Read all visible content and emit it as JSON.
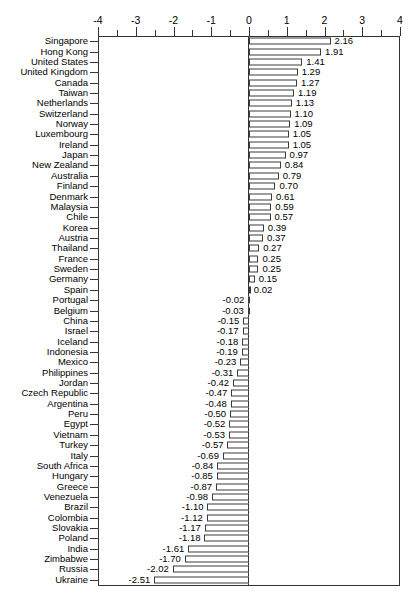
{
  "chart_data": {
    "type": "bar",
    "orientation": "horizontal",
    "title": "",
    "subtitle": "",
    "xlabel": "",
    "ylabel": "",
    "xlim": [
      -4,
      4
    ],
    "grid": false,
    "legend": null,
    "axis": {
      "major_ticks": [
        -4,
        -3,
        -2,
        -1,
        0,
        1,
        2,
        3,
        4
      ],
      "major_tick_labels": [
        "-4",
        "-3",
        "-2",
        "-1",
        "0",
        "1",
        "2",
        "3",
        "4"
      ],
      "minor_ticks": [
        -3.5,
        -2.5,
        -1.5,
        -0.5,
        0.5,
        1.5,
        2.5,
        3.5
      ],
      "tick_position": "top",
      "zero_reference_line": 0
    },
    "bar_style": {
      "fill": "#ffffff",
      "stroke": "#3a3a3a"
    },
    "value_label_format": "2 decimals",
    "categories": [
      "Singapore",
      "Hong Kong",
      "United States",
      "United Kingdom",
      "Canada",
      "Taiwan",
      "Netherlands",
      "Switzerland",
      "Norway",
      "Luxembourg",
      "Ireland",
      "Japan",
      "New Zealand",
      "Australia",
      "Finland",
      "Denmark",
      "Malaysia",
      "Chile",
      "Korea",
      "Austria",
      "Thailand",
      "France",
      "Sweden",
      "Germany",
      "Spain",
      "Portugal",
      "Belgium",
      "China",
      "Israel",
      "Iceland",
      "Indonesia",
      "Mexico",
      "Philippines",
      "Jordan",
      "Czech Republic",
      "Argentina",
      "Peru",
      "Egypt",
      "Vietnam",
      "Turkey",
      "Italy",
      "South Africa",
      "Hungary",
      "Greece",
      "Venezuela",
      "Brazil",
      "Colombia",
      "Slovakia",
      "Poland",
      "India",
      "Zimbabwe",
      "Russia",
      "Ukraine"
    ],
    "values": [
      2.16,
      1.91,
      1.41,
      1.29,
      1.27,
      1.19,
      1.13,
      1.1,
      1.09,
      1.05,
      1.05,
      0.97,
      0.84,
      0.79,
      0.7,
      0.61,
      0.59,
      0.57,
      0.39,
      0.37,
      0.27,
      0.25,
      0.25,
      0.15,
      0.02,
      -0.02,
      -0.03,
      -0.15,
      -0.17,
      -0.18,
      -0.19,
      -0.23,
      -0.31,
      -0.42,
      -0.47,
      -0.48,
      -0.5,
      -0.52,
      -0.53,
      -0.57,
      -0.69,
      -0.84,
      -0.85,
      -0.87,
      -0.98,
      -1.1,
      -1.12,
      -1.17,
      -1.18,
      -1.61,
      -1.7,
      -2.02,
      -2.51
    ],
    "value_labels": [
      "2.16",
      "1.91",
      "1.41",
      "1.29",
      "1.27",
      "1.19",
      "1.13",
      "1.10",
      "1.09",
      "1.05",
      "1.05",
      "0.97",
      "0.84",
      "0.79",
      "0.70",
      "0.61",
      "0.59",
      "0.57",
      "0.39",
      "0.37",
      "0.27",
      "0.25",
      "0.25",
      "0.15",
      "0.02",
      "-0.02",
      "-0.03",
      "-0.15",
      "-0.17",
      "-0.18",
      "-0.19",
      "-0.23",
      "-0.31",
      "-0.42",
      "-0.47",
      "-0.48",
      "-0.50",
      "-0.52",
      "-0.53",
      "-0.57",
      "-0.69",
      "-0.84",
      "-0.85",
      "-0.87",
      "-0.98",
      "-1.10",
      "-1.12",
      "-1.17",
      "-1.18",
      "-1.61",
      "-1.70",
      "-2.02",
      "-2.51"
    ]
  }
}
